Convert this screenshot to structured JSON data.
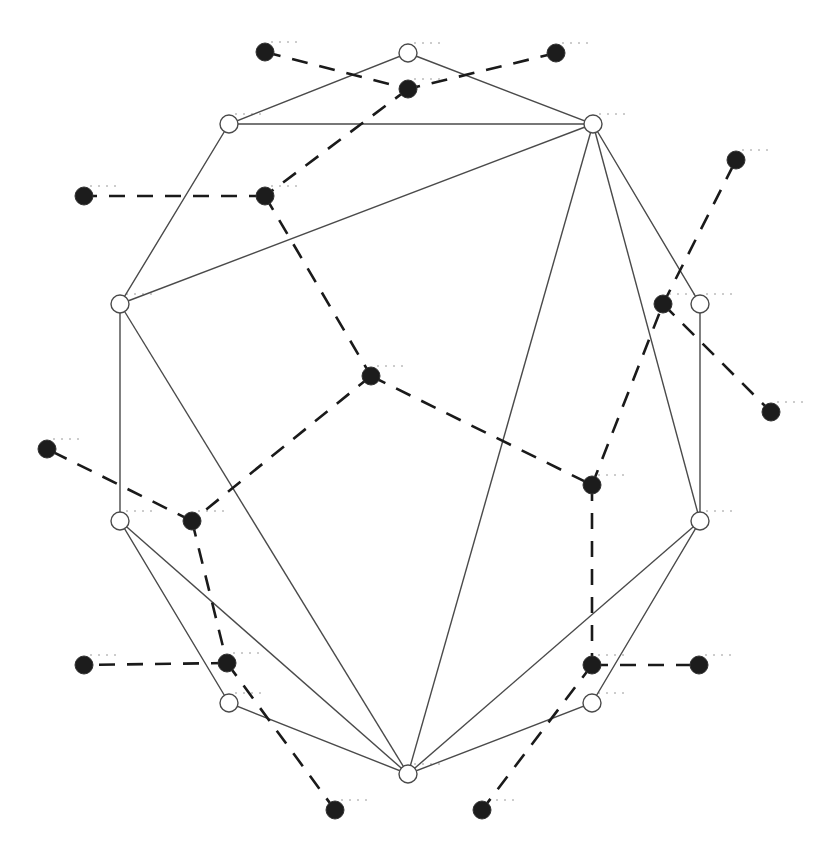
{
  "diagram": {
    "colors": {
      "background": "#ffffff",
      "polygon_stroke": "#4a4a4a",
      "dual_stroke": "#1a1a1a",
      "dual_fill": "#1c1c1c",
      "vertex_fill": "#ffffff"
    },
    "polygon_vertices": [
      {
        "id": "v0",
        "x": 408,
        "y": 53
      },
      {
        "id": "v1",
        "x": 593,
        "y": 124
      },
      {
        "id": "v2",
        "x": 700,
        "y": 304
      },
      {
        "id": "v3",
        "x": 700,
        "y": 521
      },
      {
        "id": "v4",
        "x": 592,
        "y": 703
      },
      {
        "id": "v5",
        "x": 408,
        "y": 774
      },
      {
        "id": "v6",
        "x": 229,
        "y": 703
      },
      {
        "id": "v7",
        "x": 120,
        "y": 521
      },
      {
        "id": "v8",
        "x": 120,
        "y": 304
      },
      {
        "id": "v9",
        "x": 229,
        "y": 124
      }
    ],
    "diagonals": [
      [
        "v9",
        "v1"
      ],
      [
        "v8",
        "v1"
      ],
      [
        "v8",
        "v5"
      ],
      [
        "v1",
        "v5"
      ],
      [
        "v1",
        "v3"
      ],
      [
        "v7",
        "v5"
      ],
      [
        "v3",
        "v5"
      ]
    ],
    "dual_nodes": [
      {
        "id": "t1",
        "x": 265,
        "y": 52
      },
      {
        "id": "t2",
        "x": 556,
        "y": 53
      },
      {
        "id": "a",
        "x": 408,
        "y": 89
      },
      {
        "id": "b",
        "x": 265,
        "y": 196
      },
      {
        "id": "l1",
        "x": 84,
        "y": 196
      },
      {
        "id": "r1",
        "x": 736,
        "y": 160
      },
      {
        "id": "c",
        "x": 663,
        "y": 304
      },
      {
        "id": "r2",
        "x": 771,
        "y": 412
      },
      {
        "id": "m",
        "x": 371,
        "y": 376
      },
      {
        "id": "d",
        "x": 592,
        "y": 485
      },
      {
        "id": "l2",
        "x": 47,
        "y": 449
      },
      {
        "id": "e",
        "x": 192,
        "y": 521
      },
      {
        "id": "l3",
        "x": 84,
        "y": 665
      },
      {
        "id": "f",
        "x": 227,
        "y": 663
      },
      {
        "id": "g",
        "x": 592,
        "y": 665
      },
      {
        "id": "r3",
        "x": 699,
        "y": 665
      },
      {
        "id": "b1",
        "x": 335,
        "y": 810
      },
      {
        "id": "b2",
        "x": 482,
        "y": 810
      }
    ],
    "dual_edges": [
      [
        "t1",
        "a"
      ],
      [
        "t2",
        "a"
      ],
      [
        "a",
        "b"
      ],
      [
        "b",
        "l1"
      ],
      [
        "b",
        "m"
      ],
      [
        "m",
        "e"
      ],
      [
        "m",
        "d"
      ],
      [
        "d",
        "c"
      ],
      [
        "c",
        "r1"
      ],
      [
        "c",
        "r2"
      ],
      [
        "d",
        "g"
      ],
      [
        "g",
        "r3"
      ],
      [
        "g",
        "b2"
      ],
      [
        "e",
        "l2"
      ],
      [
        "e",
        "f"
      ],
      [
        "f",
        "l3"
      ],
      [
        "f",
        "b1"
      ]
    ]
  }
}
